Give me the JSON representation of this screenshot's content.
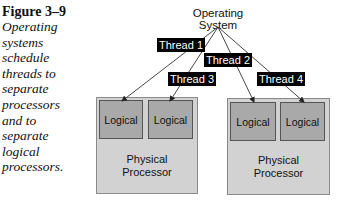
{
  "caption": {
    "figure_label": "Figure 3–9",
    "lines": [
      "Operating",
      "systems",
      "schedule",
      "threads to",
      "separate",
      "processors",
      "and to",
      "separate",
      "logical",
      "processors."
    ]
  },
  "diagram": {
    "root_label": "Operating System",
    "threads": [
      {
        "label": "Thread 1",
        "target": "processor 1, logical 1"
      },
      {
        "label": "Thread 2",
        "target": "processor 2, logical 1"
      },
      {
        "label": "Thread 3",
        "target": "processor 1, logical 2"
      },
      {
        "label": "Thread 4",
        "target": "processor 2, logical 2"
      }
    ],
    "processors": [
      {
        "label_line1": "Physical",
        "label_line2": "Processor",
        "logicals": [
          "Logical",
          "Logical"
        ]
      },
      {
        "label_line1": "Physical",
        "label_line2": "Processor",
        "logicals": [
          "Logical",
          "Logical"
        ]
      }
    ],
    "colors": {
      "physical_fill": "#d2d2d2",
      "logical_fill": "#a9a9a9",
      "thread_label_bg": "#000000",
      "thread_label_text": "#ffffff"
    }
  }
}
